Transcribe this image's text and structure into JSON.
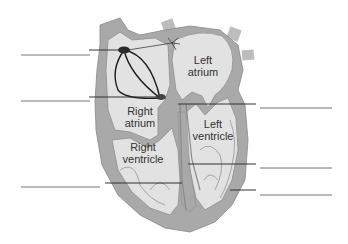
{
  "diagram": {
    "chamber_labels": {
      "left_atrium": [
        "Left",
        "atrium"
      ],
      "right_atrium": [
        "Right",
        "atrium"
      ],
      "left_ventricle": [
        "Left",
        "ventricle"
      ],
      "right_ventricle": [
        "Right",
        "ventricle"
      ]
    },
    "blank_label_lines": [
      {
        "side": "left",
        "index": 1
      },
      {
        "side": "left",
        "index": 2
      },
      {
        "side": "left",
        "index": 3
      },
      {
        "side": "right",
        "index": 1
      },
      {
        "side": "right",
        "index": 2
      },
      {
        "side": "right",
        "index": 3
      }
    ],
    "colors": {
      "wall": "#a9a9a9",
      "chamber": "#e2e2e2",
      "node": "#2a2a2a",
      "pathway": "#1e1e1e",
      "background": "#ffffff"
    }
  }
}
